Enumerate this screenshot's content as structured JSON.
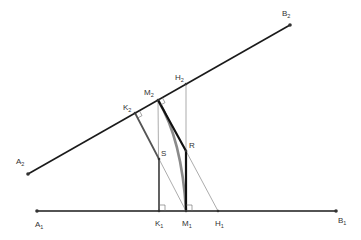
{
  "diagram": {
    "colors": {
      "line": "#1a1a1a",
      "thin": "#777777",
      "gray_thick": "#555555",
      "arc": "#8a8a8a",
      "point": "#333333",
      "label": "#333333"
    },
    "points": {
      "A1": {
        "base": "A",
        "sub": "1",
        "x": 37,
        "y": 211
      },
      "B1": {
        "base": "B",
        "sub": "1",
        "x": 336,
        "y": 211
      },
      "A2": {
        "base": "A",
        "sub": "2",
        "x": 28,
        "y": 174
      },
      "B2": {
        "base": "B",
        "sub": "2",
        "x": 290,
        "y": 25
      },
      "K1": {
        "base": "K",
        "sub": "1",
        "x": 159,
        "y": 211
      },
      "M1": {
        "base": "M",
        "sub": "1",
        "x": 186,
        "y": 211
      },
      "H1": {
        "base": "H",
        "sub": "1",
        "x": 218,
        "y": 211
      },
      "K2": {
        "base": "K",
        "sub": "2",
        "x": 135,
        "y": 113
      },
      "M2": {
        "base": "M",
        "sub": "2",
        "x": 158,
        "y": 100
      },
      "H2": {
        "base": "H",
        "sub": "2",
        "x": 186,
        "y": 84
      },
      "S": {
        "base": "S",
        "sub": "",
        "x": 159,
        "y": 159
      },
      "R": {
        "base": "R",
        "sub": "",
        "x": 186,
        "y": 151
      }
    },
    "labels": {
      "A1": "A",
      "A1_sub": "1",
      "B1": "B",
      "B1_sub": "1",
      "A2": "A",
      "A2_sub": "2",
      "B2": "B",
      "B2_sub": "2",
      "K1": "K",
      "K1_sub": "1",
      "M1": "M",
      "M1_sub": "1",
      "H1": "H",
      "H1_sub": "1",
      "K2": "K",
      "K2_sub": "2",
      "M2": "M",
      "M2_sub": "2",
      "H2": "H",
      "H2_sub": "2",
      "S": "S",
      "R": "R"
    },
    "segments": [
      {
        "from": "A1",
        "to": "B1",
        "style": "thick"
      },
      {
        "from": "A2",
        "to": "B2",
        "style": "thick"
      },
      {
        "from": "K2",
        "to": "S",
        "style": "gray-thick"
      },
      {
        "from": "S",
        "to": "K1",
        "style": "gray-thick"
      },
      {
        "from": "M2",
        "to": "R",
        "style": "thick"
      },
      {
        "from": "R",
        "to": "M1",
        "style": "thick"
      },
      {
        "from": "M2",
        "to": "K1",
        "style": "thin"
      },
      {
        "from": "H2",
        "to": "R",
        "style": "thin"
      },
      {
        "from": "S",
        "to": "M1",
        "style": "thin"
      },
      {
        "from": "R",
        "to": "H1",
        "style": "thin"
      }
    ],
    "arcs": [
      {
        "from": "M2",
        "to": "M1",
        "style": "gray-arc"
      }
    ],
    "right_angle_marks": [
      "K2",
      "M2",
      "K1",
      "M1"
    ]
  }
}
